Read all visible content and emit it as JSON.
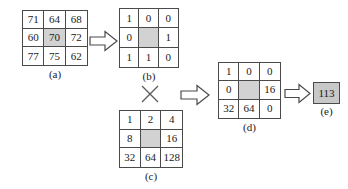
{
  "figure": {
    "type": "local-binary-pattern-diagram",
    "background_color": "#ffffff",
    "line_color": "#4a4a4a",
    "shade_color": "#d2d2d2",
    "result_fill_color": "#c8c8c8"
  },
  "matrices": {
    "a": {
      "label": "(a)",
      "rows": [
        [
          "71",
          "64",
          "68"
        ],
        [
          "60",
          "70",
          "72"
        ],
        [
          "77",
          "75",
          "62"
        ]
      ],
      "shaded": [
        [
          1,
          1
        ]
      ]
    },
    "b": {
      "label": "(b)",
      "rows": [
        [
          "1",
          "0",
          "0"
        ],
        [
          "0",
          "",
          "1"
        ],
        [
          "1",
          "1",
          "0"
        ]
      ],
      "shaded": [
        [
          1,
          1
        ]
      ]
    },
    "c": {
      "label": "(c)",
      "rows": [
        [
          "1",
          "2",
          "4"
        ],
        [
          "8",
          "",
          "16"
        ],
        [
          "32",
          "64",
          "128"
        ]
      ],
      "shaded": [
        [
          1,
          1
        ]
      ]
    },
    "d": {
      "label": "(d)",
      "rows": [
        [
          "1",
          "0",
          "0"
        ],
        [
          "0",
          "",
          "16"
        ],
        [
          "32",
          "64",
          "0"
        ]
      ],
      "shaded": [
        [
          1,
          1
        ]
      ]
    }
  },
  "result": {
    "label": "(e)",
    "value": "113"
  },
  "operators": {
    "multiply_symbol": "×"
  },
  "icons": {
    "arrow_threshold": "block-arrow-right-icon",
    "arrow_weight": "block-arrow-right-icon",
    "arrow_sum": "block-arrow-right-icon",
    "multiply": "multiply-icon"
  }
}
